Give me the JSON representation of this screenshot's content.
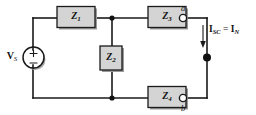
{
  "figure": {
    "kind": "circuit-diagram",
    "background_color": "#ffffff",
    "wire_color": "#1a1a1a",
    "component_fill": "#d4d4d4"
  },
  "source": {
    "label": "V",
    "label_subscript": "S",
    "type": "independent-voltage-source",
    "plus_sign": "+",
    "minus_sign": "−"
  },
  "impedances": [
    {
      "id": "z1",
      "label": "Z",
      "subscript": "1",
      "orientation": "horizontal",
      "branch": "top-left"
    },
    {
      "id": "z2",
      "label": "Z",
      "subscript": "2",
      "orientation": "vertical",
      "branch": "middle-bridge"
    },
    {
      "id": "z3",
      "label": "Z",
      "subscript": "3",
      "orientation": "horizontal",
      "branch": "top-right"
    },
    {
      "id": "z4",
      "label": "Z",
      "subscript": "4",
      "orientation": "horizontal",
      "branch": "bottom-right"
    }
  ],
  "terminals": [
    {
      "id": "a",
      "label": "a",
      "style": "open-circle",
      "position": "top-right"
    },
    {
      "id": "b",
      "label": "b",
      "style": "open-circle",
      "position": "bottom-right"
    }
  ],
  "current": {
    "symbol": "I",
    "subscript": "SC",
    "equals": "=",
    "symbol2": "I",
    "subscript2": "N",
    "text": "I_SC = I_N",
    "direction": "downward",
    "arrow": "down-arrow"
  },
  "nodes": [
    {
      "id": "node-top-mid",
      "type": "junction-dot"
    },
    {
      "id": "node-bottom-mid",
      "type": "junction-dot"
    },
    {
      "id": "node-short-circuit",
      "type": "junction-dot"
    }
  ]
}
